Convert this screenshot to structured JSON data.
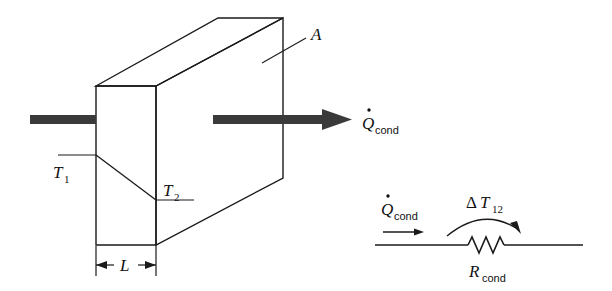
{
  "figure": {
    "background_color": "#ffffff",
    "line_color": "#1a1a1a",
    "arrow_fill_color": "#3a3a3a"
  },
  "wall": {
    "area_label": "A",
    "thickness_label": "L",
    "temperature_hot_label": "T",
    "temperature_hot_subscript": "1",
    "temperature_cold_label": "T",
    "temperature_cold_subscript": "2"
  },
  "heat_flow": {
    "symbol": "Q",
    "dot_accent": "˙",
    "subscript": "cond",
    "inlet_arrow_name": "heat-in-arrow",
    "outlet_arrow_name": "heat-out-arrow"
  },
  "resistance_network": {
    "flow_symbol": "Q",
    "flow_subscript": "cond",
    "delta_symbol": "Δ",
    "delta_temperature_symbol": "T",
    "delta_temperature_subscript": "12",
    "resistance_symbol": "R",
    "resistance_subscript": "cond"
  }
}
